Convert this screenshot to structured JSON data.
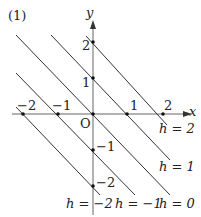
{
  "figure": {
    "part_label": "(1)",
    "x_axis_label": "x",
    "y_axis_label": "y",
    "origin_label": "O",
    "x_ticks": [
      {
        "label": "−2",
        "value": -2
      },
      {
        "label": "−1",
        "value": -1
      },
      {
        "label": "1",
        "value": 1
      },
      {
        "label": "2",
        "value": 2
      }
    ],
    "y_ticks": [
      {
        "label": "2",
        "value": 2
      },
      {
        "label": "1",
        "value": 1
      },
      {
        "label": "−1",
        "value": -1
      },
      {
        "label": "−2",
        "value": -2
      }
    ],
    "lines": [
      {
        "h": 2,
        "label": "h = 2",
        "equation": "x + y = 2"
      },
      {
        "h": 1,
        "label": "h = 1",
        "equation": "x + y = 1"
      },
      {
        "h": 0,
        "label": "h = 0",
        "equation": "x + y = 0"
      },
      {
        "h": -1,
        "label": "h = −1",
        "equation": "x + y = −1"
      },
      {
        "h": -2,
        "label": "h = −2",
        "equation": "x + y = −2"
      }
    ],
    "colors": {
      "ink": "#333333",
      "axis": "#555555"
    }
  }
}
